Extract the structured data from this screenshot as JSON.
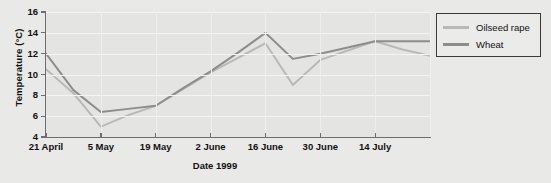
{
  "chart_data": {
    "type": "line",
    "title": "",
    "xlabel": "Date  1999",
    "ylabel": "Temperature (°C)",
    "ylim": [
      4,
      16
    ],
    "yticks": [
      4,
      6,
      8,
      10,
      12,
      14,
      16
    ],
    "ytick_labels": [
      "4",
      "6",
      "8",
      "10",
      "12",
      "14",
      "16"
    ],
    "grid": "horizontal",
    "legend_position": "outside-right-top",
    "categories": [
      "21 April",
      "28 April",
      "5 May",
      "12 May",
      "19 May",
      "26 May",
      "2 June",
      "9 June",
      "16 June",
      "23 June",
      "30 June",
      "7 July",
      "14 July",
      "21 July",
      "28 July"
    ],
    "xtick_labels": [
      "21 April",
      "5 May",
      "19 May",
      "2 June",
      "16 June",
      "30 June",
      "14 July"
    ],
    "series": [
      {
        "name": "Oilseed rape",
        "color": "#b9b9b7",
        "values": [
          10.5,
          8.2,
          5.0,
          6.1,
          7.0,
          8.6,
          10.2,
          11.6,
          13.0,
          9.0,
          11.4,
          12.3,
          13.2,
          12.4,
          11.8
        ]
      },
      {
        "name": "Wheat",
        "color": "#8d8d8b",
        "values": [
          12.0,
          8.5,
          6.4,
          6.7,
          7.0,
          8.7,
          10.3,
          12.1,
          14.0,
          11.5,
          12.0,
          12.6,
          13.2,
          13.2,
          13.2
        ]
      }
    ]
  },
  "legend": {
    "items": [
      {
        "label": "Oilseed rape",
        "color": "#b9b9b7"
      },
      {
        "label": "Wheat",
        "color": "#8d8d8b"
      }
    ]
  },
  "axes": {
    "y_title": "Temperature (°C)",
    "x_title": "Date  1999"
  }
}
